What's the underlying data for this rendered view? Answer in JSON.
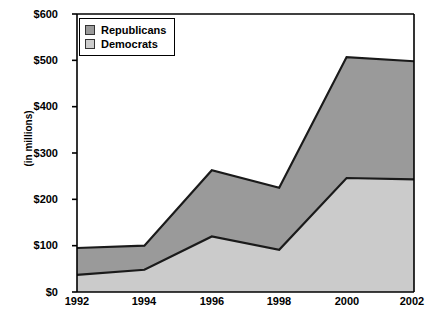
{
  "chart_data": {
    "type": "area",
    "title": "",
    "subtitle": "",
    "xlabel": "",
    "ylabel": "(in millions)",
    "categories": [
      "1992",
      "1994",
      "1996",
      "1998",
      "2000",
      "2002"
    ],
    "x": [
      1992,
      1994,
      1996,
      1998,
      2000,
      2002
    ],
    "stacked": true,
    "series": [
      {
        "name": "Democrats",
        "color": "#cbcbcb",
        "values": [
          37,
          48,
          120,
          91,
          246,
          243
        ]
      },
      {
        "name": "Republicans",
        "color": "#9a9a9a",
        "values": [
          58,
          52,
          143,
          134,
          261,
          255
        ]
      }
    ],
    "cumulative_totals": [
      95,
      100,
      263,
      225,
      507,
      498
    ],
    "ylim": [
      0,
      600
    ],
    "xlim": [
      1992,
      2002
    ],
    "y_ticks": [
      0,
      100,
      200,
      300,
      400,
      500,
      600
    ],
    "y_tick_labels": [
      "$0",
      "$100",
      "$200",
      "$300",
      "$400",
      "$500",
      "$600"
    ],
    "x_tick_labels": [
      "1992",
      "1994",
      "1996",
      "1998",
      "2000",
      "2002"
    ],
    "grid": false,
    "legend_position": "top-left",
    "legend_entries": [
      {
        "label": "Republicans",
        "color": "#9a9a9a"
      },
      {
        "label": "Democrats",
        "color": "#cbcbcb"
      }
    ],
    "axis_color": "#000000",
    "line_color": "#1a1a1a",
    "background": "#ffffff"
  },
  "legend": {
    "items": [
      {
        "label": "Republicans"
      },
      {
        "label": "Democrats"
      }
    ]
  },
  "axes": {
    "y_title": "(in millions)",
    "y_labels": [
      "$600",
      "$500",
      "$400",
      "$300",
      "$200",
      "$100",
      "$0"
    ],
    "x_labels": [
      "1992",
      "1994",
      "1996",
      "1998",
      "2000",
      "2002"
    ]
  }
}
